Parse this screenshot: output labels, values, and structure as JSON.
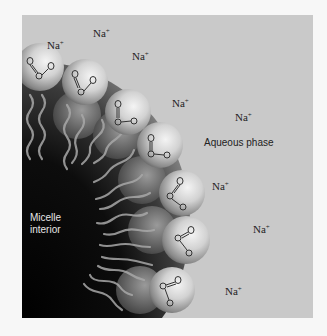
{
  "figure": {
    "labels": {
      "aqueous_phase": "Aqueous phase",
      "micelle_interior_line1": "Micelle",
      "micelle_interior_line2": "interior"
    },
    "ions": [
      {
        "symbol": "Na",
        "charge": "+",
        "x": 25,
        "y": 24
      },
      {
        "symbol": "Na",
        "charge": "+",
        "x": 71,
        "y": 12
      },
      {
        "symbol": "Na",
        "charge": "+",
        "x": 110,
        "y": 35
      },
      {
        "symbol": "Na",
        "charge": "+",
        "x": 150,
        "y": 82
      },
      {
        "symbol": "Na",
        "charge": "+",
        "x": 213,
        "y": 96
      },
      {
        "symbol": "Na",
        "charge": "+",
        "x": 190,
        "y": 165
      },
      {
        "symbol": "Na",
        "charge": "+",
        "x": 231,
        "y": 208
      },
      {
        "symbol": "Na",
        "charge": "+",
        "x": 203,
        "y": 270
      }
    ],
    "headgroup": {
      "atoms": [
        "O",
        "C",
        "O"
      ],
      "charge": "-",
      "count": 9
    },
    "colors": {
      "background": "#f7f7f7",
      "aqueous": "#c9c9c9",
      "interior": "#0a0a0a",
      "sphere_highlight": "#f2f2f2",
      "sphere_shadow": "#6e6e6e",
      "tail": "#a8a8a8"
    }
  }
}
